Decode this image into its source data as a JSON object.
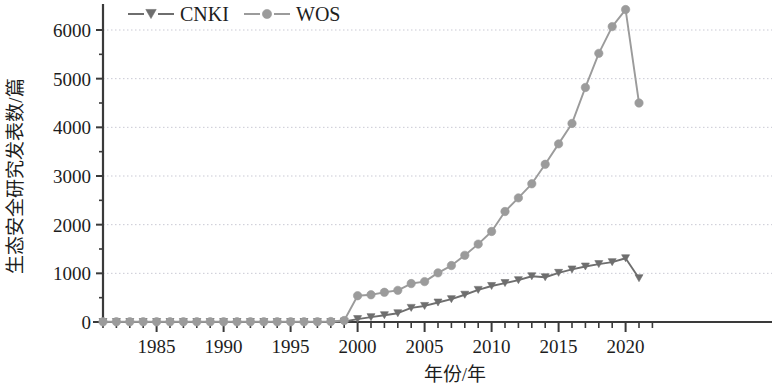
{
  "chart_data": {
    "type": "line",
    "title": "",
    "xlabel": "年份/年",
    "ylabel": "生态安全研究发表数/篇",
    "xlim": [
      1981,
      2022
    ],
    "ylim": [
      0,
      6600
    ],
    "grid": true,
    "grid_axis": "y",
    "legend_position": "top-left",
    "x_major_ticks": [
      1985,
      1990,
      1995,
      2000,
      2005,
      2010,
      2015,
      2020
    ],
    "x_minor_tick_interval": 1,
    "y_ticks": [
      0,
      1000,
      2000,
      3000,
      4000,
      5000,
      6000
    ],
    "x": [
      1981,
      1982,
      1983,
      1984,
      1985,
      1986,
      1987,
      1988,
      1989,
      1990,
      1991,
      1992,
      1993,
      1994,
      1995,
      1996,
      1997,
      1998,
      1999,
      2000,
      2001,
      2002,
      2003,
      2004,
      2005,
      2006,
      2007,
      2008,
      2009,
      2010,
      2011,
      2012,
      2013,
      2014,
      2015,
      2016,
      2017,
      2018,
      2019,
      2020,
      2021
    ],
    "series": [
      {
        "name": "CNKI",
        "color": "#6e6e6e",
        "marker": "triangle-down",
        "values": [
          0,
          0,
          0,
          0,
          0,
          0,
          0,
          0,
          0,
          0,
          0,
          0,
          0,
          0,
          0,
          0,
          0,
          0,
          10,
          60,
          100,
          140,
          180,
          290,
          330,
          400,
          470,
          560,
          660,
          740,
          800,
          860,
          940,
          920,
          1010,
          1080,
          1140,
          1190,
          1230,
          1310,
          900
        ]
      },
      {
        "name": "WOS",
        "color": "#9b9b9b",
        "marker": "circle",
        "values": [
          5,
          5,
          5,
          5,
          5,
          5,
          5,
          5,
          5,
          5,
          5,
          5,
          5,
          5,
          5,
          5,
          5,
          10,
          30,
          540,
          560,
          610,
          650,
          790,
          830,
          1010,
          1160,
          1370,
          1600,
          1860,
          2270,
          2550,
          2840,
          3240,
          3660,
          4080,
          4820,
          5520,
          6070,
          6420,
          4500
        ]
      }
    ]
  },
  "legend": {
    "items": [
      {
        "label": "CNKI",
        "color": "#6e6e6e",
        "marker": "triangle-down"
      },
      {
        "label": "WOS",
        "color": "#9b9b9b",
        "marker": "circle"
      }
    ]
  },
  "axes": {
    "y_title": "生态安全研究发表数/篇",
    "x_title": "年份/年",
    "y_tick_labels": [
      "0",
      "1000",
      "2000",
      "3000",
      "4000",
      "5000",
      "6000"
    ],
    "x_tick_labels": [
      "1985",
      "1990",
      "1995",
      "2000",
      "2005",
      "2010",
      "2015",
      "2020"
    ]
  }
}
